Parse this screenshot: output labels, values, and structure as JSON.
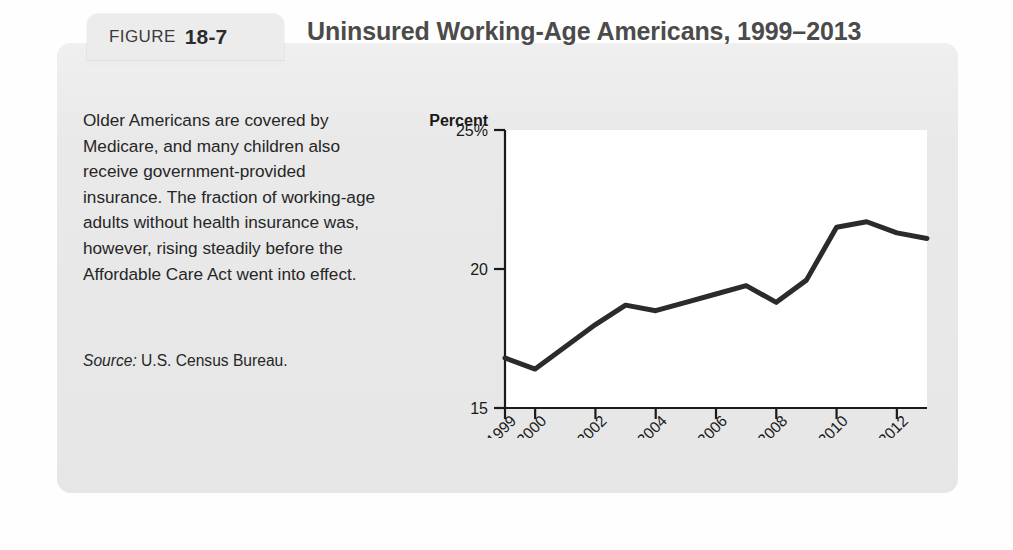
{
  "figure": {
    "tab_word": "FIGURE",
    "number": "18-7",
    "title": "Uninsured Working-Age Americans, 1999–2013"
  },
  "caption": {
    "body": "Older Americans are covered by Medicare, and many children also receive government-provided insurance. The fraction of working-age adults without health insurance was, however, rising steadily before the Affordable Care Act went into effect.",
    "source_label": "Source:",
    "source_value": "U.S. Census Bureau."
  },
  "chart_data": {
    "type": "line",
    "title": "Uninsured Working-Age Americans, 1999–2013",
    "xlabel": "Year",
    "ylabel": "Percent",
    "ylim": [
      15,
      25
    ],
    "yticks": [
      15,
      20,
      25
    ],
    "ytick_labels": [
      "15",
      "20",
      "25%"
    ],
    "xlim": [
      1999,
      2013
    ],
    "xticks": [
      1999,
      2000,
      2002,
      2004,
      2006,
      2008,
      2010,
      2012
    ],
    "xtick_labels": [
      "1999",
      "2000",
      "2002",
      "2004",
      "2006",
      "2008",
      "2010",
      "2012"
    ],
    "grid": false,
    "legend": null,
    "series": [
      {
        "name": "Percent of working-age adults uninsured",
        "color": "#2b2b2b",
        "x": [
          1999,
          2000,
          2001,
          2002,
          2003,
          2004,
          2005,
          2006,
          2007,
          2008,
          2009,
          2010,
          2011,
          2012,
          2013
        ],
        "values": [
          16.8,
          16.4,
          17.2,
          18.0,
          18.7,
          18.5,
          18.8,
          19.1,
          19.4,
          18.8,
          19.6,
          21.5,
          21.7,
          21.3,
          21.1
        ]
      }
    ]
  }
}
